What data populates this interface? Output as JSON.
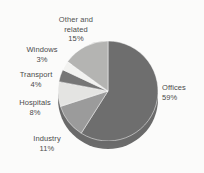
{
  "chart_data": {
    "type": "pie",
    "title": "",
    "categories": [
      "Offices",
      "Industry",
      "Hospitals",
      "Transport",
      "Windows",
      "Other and related"
    ],
    "values": [
      59,
      11,
      8,
      4,
      3,
      15
    ],
    "value_unit": "%",
    "legend": "none",
    "slices": [
      {
        "label": "Offices",
        "value": 59,
        "value_text": "59%",
        "color": "#6e6e6e",
        "start_angle": 0,
        "end_angle": 212.4
      },
      {
        "label": "Industry",
        "value": 11,
        "value_text": "11%",
        "color": "#9b9b9b",
        "start_angle": 212.4,
        "end_angle": 252.0
      },
      {
        "label": "Hospitals",
        "value": 8,
        "value_text": "8%",
        "color": "#e4e4e2",
        "start_angle": 252.0,
        "end_angle": 280.8
      },
      {
        "label": "Transport",
        "value": 4,
        "value_text": "4%",
        "color": "#767676",
        "start_angle": 280.8,
        "end_angle": 295.2
      },
      {
        "label": "Windows",
        "value": 3,
        "value_text": "3%",
        "color": "#f2f2f0",
        "start_angle": 295.2,
        "end_angle": 306.0
      },
      {
        "label": "Other and related",
        "value": 15,
        "value_text": "15%",
        "color": "#b4b4b2",
        "start_angle": 306.0,
        "end_angle": 360.0
      }
    ]
  },
  "labels": {
    "other": {
      "line1": "Other and",
      "line2": "related",
      "pct": "15%"
    },
    "windows": {
      "line1": "Windows",
      "pct": "3%"
    },
    "transport": {
      "line1": "Transport",
      "pct": "4%"
    },
    "hospitals": {
      "line1": "Hospitals",
      "pct": "8%"
    },
    "industry": {
      "line1": "Industry",
      "pct": "11%"
    },
    "offices": {
      "line1": "Offices",
      "pct": "59%"
    }
  },
  "colors": {
    "background": "#fbfbfa",
    "text": "#4a4a4a",
    "rim": "#5d5d5d"
  }
}
